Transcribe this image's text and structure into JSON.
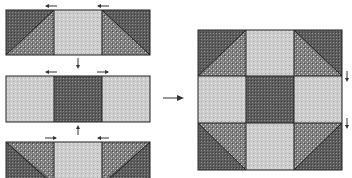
{
  "diagram": {
    "colors": {
      "dark": "#5a5a5a",
      "medium": "#8e8e8e",
      "light": "#cfcfcf",
      "outline": "#222222",
      "arrow": "#333333"
    },
    "rows": [
      {
        "name": "top-row",
        "units": [
          "hst-dark-left",
          "light-square",
          "hst-dark-right"
        ],
        "press_arrows": [
          "left",
          "left"
        ]
      },
      {
        "name": "middle-row",
        "units": [
          "light-square",
          "dark-square",
          "light-square"
        ],
        "press_arrows": [
          "left",
          "right"
        ]
      },
      {
        "name": "bottom-row",
        "units": [
          "hst-dark-left-bottom",
          "light-square",
          "hst-dark-right-bottom"
        ],
        "press_arrows": [
          "right",
          "left"
        ]
      }
    ],
    "assembly_arrow": "right",
    "seam_arrows": [
      "down",
      "down"
    ]
  }
}
